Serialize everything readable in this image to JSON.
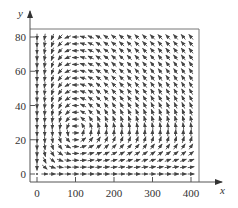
{
  "chart_data": {
    "type": "vector-field",
    "title": "",
    "xlabel": "x",
    "ylabel": "y",
    "xlim": [
      -20,
      420
    ],
    "ylim": [
      -5,
      85
    ],
    "x_ticks": [
      0,
      100,
      200,
      300,
      400
    ],
    "y_ticks": [
      0,
      20,
      40,
      60,
      80
    ],
    "x_tick_labels": [
      "0",
      "100",
      "200",
      "300",
      "400"
    ],
    "y_tick_labels": [
      "0",
      "20",
      "40",
      "60",
      "80"
    ],
    "grid": false,
    "legend": null,
    "field": {
      "description": "Predator-prey (Lotka-Volterra) direction field",
      "equilibrium": [
        100,
        25
      ],
      "dx_dt": "x*(1 - y/25)",
      "dy_dt": "y*(x/100 - 1)",
      "x_samples": [
        0,
        20,
        40,
        60,
        80,
        100,
        120,
        140,
        160,
        180,
        200,
        220,
        240,
        260,
        280,
        300,
        320,
        340,
        360,
        380,
        400
      ],
      "y_samples": [
        0,
        4,
        8,
        12,
        16,
        20,
        24,
        28,
        32,
        36,
        40,
        44,
        48,
        52,
        56,
        60,
        64,
        68,
        72,
        76,
        80
      ]
    },
    "colors": {
      "arrow": "#444444",
      "axis": "#555555",
      "frame": "#777777"
    }
  }
}
